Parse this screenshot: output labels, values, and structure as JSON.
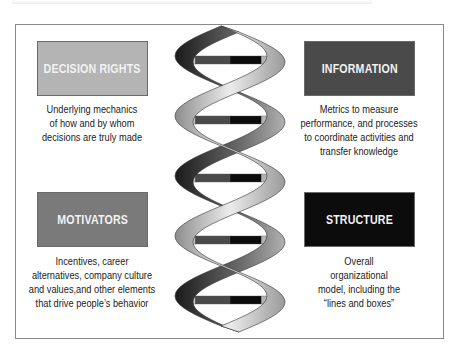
{
  "diagram": {
    "elements": [
      {
        "id": "decision-rights",
        "title": "DECISION RIGHTS",
        "description_lines": [
          "Underlying mechanics",
          "of how and by whom",
          "decisions are truly made"
        ],
        "color": "#b4b4b4"
      },
      {
        "id": "information",
        "title": "INFORMATION",
        "description_lines": [
          "Metrics to measure",
          "performance, and processes",
          "to coordinate activities and",
          "transfer knowledge"
        ],
        "color": "#4a4a4a"
      },
      {
        "id": "motivators",
        "title": "MOTIVATORS",
        "description_lines": [
          "Incentives, career",
          "alternatives, company culture",
          "and values,and other elements",
          "that drive people’s behavior"
        ],
        "color": "#7a7a7a"
      },
      {
        "id": "structure",
        "title": "STRUCTURE",
        "description_lines": [
          "Overall",
          "organizational",
          "model, including the",
          "“lines and boxes”"
        ],
        "color": "#0c0c0c"
      }
    ],
    "helix": {
      "rung_count": 5,
      "rung_segment_colors": [
        "#c8c8c8",
        "#4a4a4a",
        "#0c0c0c",
        "#b4b4b4"
      ],
      "strand_color": "#bdbdbd",
      "strand_shadow": "#2a2a2a"
    }
  }
}
